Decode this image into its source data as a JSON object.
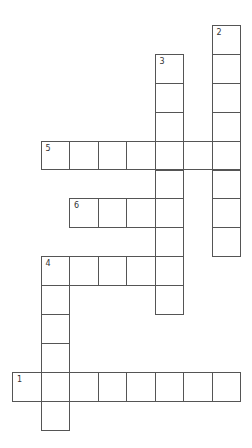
{
  "puzzle": {
    "type": "crossword",
    "grid": {
      "origin_x": 12,
      "origin_y": 25,
      "cell_w": 28.5,
      "cell_h": 28.9,
      "border_color": "#555555"
    },
    "entries": [
      {
        "number": "1",
        "direction": "across",
        "row": 12,
        "col": 0,
        "length": 8
      },
      {
        "number": "2",
        "direction": "down",
        "row": 0,
        "col": 7,
        "length": 8
      },
      {
        "number": "3",
        "direction": "down",
        "row": 1,
        "col": 5,
        "length": 9
      },
      {
        "number": "4",
        "direction": "across",
        "row": 8,
        "col": 1,
        "length": 5
      },
      {
        "number": "4",
        "direction": "down",
        "row": 8,
        "col": 1,
        "length": 6
      },
      {
        "number": "5",
        "direction": "across",
        "row": 4,
        "col": 1,
        "length": 7
      },
      {
        "number": "6",
        "direction": "across",
        "row": 6,
        "col": 2,
        "length": 4
      }
    ]
  }
}
